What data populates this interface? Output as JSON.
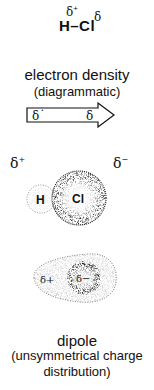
{
  "formula": {
    "atom_left": "H",
    "bond": "–",
    "atom_right": "Cl",
    "partial_left": "δ",
    "partial_left_sign": "+",
    "partial_right": "δ"
  },
  "section1": {
    "title": "electron density",
    "subtitle": "(diagrammatic)",
    "arrow": {
      "left_label": "δ˙",
      "right_label": "δ"
    }
  },
  "section2": {
    "partial_positive": "δ",
    "partial_positive_sign": "+",
    "partial_negative": "δ",
    "partial_negative_sign": "−",
    "atom_h": "H",
    "atom_cl": "Cl"
  },
  "section3": {
    "inner_left": "δ+",
    "inner_right": "δ−"
  },
  "caption": {
    "title": "dipole",
    "line1": "(unsymmetrical charge",
    "line2": "distribution)"
  },
  "colors": {
    "ink": "#111111",
    "background": "#ffffff",
    "stipple_light": "#777777",
    "stipple_dense": "#1a1a1a"
  }
}
